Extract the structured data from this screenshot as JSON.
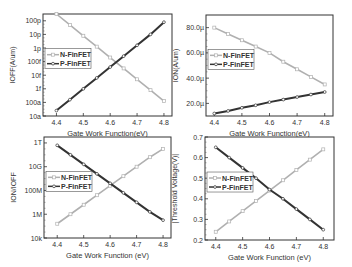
{
  "chart_data": [
    {
      "id": "ioff",
      "type": "line",
      "title": "",
      "xlabel": "Gate Work Function(eV)",
      "ylabel": "IOFF(A/um)",
      "yscale": "log",
      "xlim": [
        4.35,
        4.83
      ],
      "ylim_log10": [
        -17,
        -9.5
      ],
      "x_ticks": [
        4.4,
        4.5,
        4.6,
        4.7,
        4.8
      ],
      "x_tick_labels": [
        "4.4",
        "4.5",
        "4.6",
        "4.7",
        "4.8"
      ],
      "y_ticks_log10": [
        -17,
        -16,
        -15,
        -14,
        -13,
        -12,
        -11,
        -10
      ],
      "y_tick_labels": [
        "10a",
        "100a",
        "1f",
        "10f",
        "100f",
        "1p",
        "10p",
        "100p"
      ],
      "legend": {
        "position": "left-middle",
        "entries": [
          "N-FinFET",
          "P-FinFET"
        ]
      },
      "x": [
        4.4,
        4.45,
        4.5,
        4.55,
        4.6,
        4.65,
        4.7,
        4.75,
        4.8
      ],
      "series": [
        {
          "name": "N-FinFET",
          "color": "#b0b0b0",
          "marker": "square-open",
          "values_log10": [
            -9.5,
            -10.3,
            -11.1,
            -11.9,
            -12.7,
            -13.5,
            -14.3,
            -15.1,
            -15.9
          ]
        },
        {
          "name": "P-FinFET",
          "color": "#333333",
          "marker": "circle-open",
          "values_log10": [
            -16.6,
            -15.8,
            -15.0,
            -14.2,
            -13.4,
            -12.6,
            -11.8,
            -11.0,
            -10.1
          ]
        }
      ]
    },
    {
      "id": "ion",
      "type": "line",
      "title": "",
      "xlabel": "Gate Work Function(eV)",
      "ylabel": "ION(A/um)",
      "yscale": "linear",
      "xlim": [
        4.37,
        4.83
      ],
      "ylim": [
        10,
        90
      ],
      "y_unit": "µA/um",
      "x_ticks": [
        4.4,
        4.5,
        4.6,
        4.7,
        4.8
      ],
      "x_tick_labels": [
        "4.4",
        "4.5",
        "4.6",
        "4.7",
        "4.8"
      ],
      "y_ticks": [
        20,
        40,
        60,
        80
      ],
      "y_tick_labels": [
        "20.0µ",
        "40.0µ",
        "60.0µ",
        "80.0µ"
      ],
      "legend": {
        "position": "left-middle",
        "entries": [
          "N-FinFET",
          "P-FinFET"
        ]
      },
      "x": [
        4.4,
        4.45,
        4.5,
        4.55,
        4.6,
        4.65,
        4.7,
        4.75,
        4.8
      ],
      "series": [
        {
          "name": "N-FinFET",
          "color": "#b0b0b0",
          "marker": "square-open",
          "values": [
            80,
            75,
            70,
            65,
            60,
            53,
            47,
            41,
            35
          ]
        },
        {
          "name": "P-FinFET",
          "color": "#333333",
          "marker": "circle-open",
          "values": [
            12,
            14,
            16.5,
            18.5,
            21,
            23,
            25,
            27,
            29
          ]
        }
      ]
    },
    {
      "id": "ion_ioff",
      "type": "line",
      "title": "",
      "xlabel": "Gate Work Function (eV)",
      "ylabel": "ION/IOFF",
      "yscale": "log",
      "xlim": [
        4.35,
        4.83
      ],
      "ylim_log10": [
        4,
        12.5
      ],
      "x_ticks": [
        4.4,
        4.5,
        4.6,
        4.7,
        4.8
      ],
      "x_tick_labels": [
        "4.4",
        "4.5",
        "4.6",
        "4.7",
        "4.8"
      ],
      "y_ticks_log10": [
        4,
        6,
        8,
        10,
        12
      ],
      "y_tick_labels": [
        "10k",
        "1M",
        "100M",
        "10G",
        "1T"
      ],
      "legend": {
        "position": "left-middle",
        "entries": [
          "N-FinFET",
          "P-FinFET"
        ]
      },
      "x": [
        4.4,
        4.45,
        4.5,
        4.55,
        4.6,
        4.65,
        4.7,
        4.75,
        4.8
      ],
      "series": [
        {
          "name": "N-FinFET",
          "color": "#b0b0b0",
          "marker": "square-open",
          "values_log10": [
            5.2,
            6.0,
            6.8,
            7.6,
            8.4,
            9.2,
            10.0,
            10.8,
            11.5
          ]
        },
        {
          "name": "P-FinFET",
          "color": "#333333",
          "marker": "circle-open",
          "values_log10": [
            11.8,
            11.0,
            10.2,
            9.4,
            8.6,
            7.8,
            7.0,
            6.2,
            5.5
          ]
        }
      ]
    },
    {
      "id": "vth",
      "type": "line",
      "title": "",
      "xlabel": "Gate Work Function (eV)",
      "ylabel": "|Threshold Voltage(V)|",
      "yscale": "linear",
      "xlim": [
        4.36,
        4.84
      ],
      "ylim": [
        0.2,
        0.7
      ],
      "x_ticks": [
        4.4,
        4.5,
        4.6,
        4.7,
        4.8
      ],
      "x_tick_labels": [
        "4.4",
        "4.5",
        "4.6",
        "4.7",
        "4.8"
      ],
      "y_ticks": [
        0.2,
        0.3,
        0.4,
        0.5,
        0.6,
        0.7
      ],
      "y_tick_labels": [
        "0.2",
        "0.3",
        "0.4",
        "0.5",
        "0.6",
        "0.7"
      ],
      "legend": {
        "position": "left-middle",
        "entries": [
          "N-FinFET",
          "P-FinFET"
        ]
      },
      "x": [
        4.4,
        4.45,
        4.5,
        4.55,
        4.6,
        4.65,
        4.7,
        4.75,
        4.8
      ],
      "series": [
        {
          "name": "N-FinFET",
          "color": "#b0b0b0",
          "marker": "square-open",
          "values": [
            0.24,
            0.29,
            0.34,
            0.39,
            0.44,
            0.49,
            0.54,
            0.59,
            0.64
          ]
        },
        {
          "name": "P-FinFET",
          "color": "#333333",
          "marker": "circle-open",
          "values": [
            0.65,
            0.6,
            0.55,
            0.5,
            0.445,
            0.4,
            0.35,
            0.3,
            0.25
          ]
        }
      ]
    }
  ],
  "layout": {
    "panels": [
      {
        "id": "ioff",
        "frame": [
          43,
          14,
          172,
          116
        ],
        "label_pos": [
          100,
          128
        ]
      },
      {
        "id": "ion",
        "frame": [
          206,
          15,
          333,
          116
        ],
        "label_pos": [
          270,
          128
        ]
      },
      {
        "id": "ion_ioff",
        "frame": [
          44,
          137,
          171,
          238
        ],
        "label_pos": [
          108,
          250
        ]
      },
      {
        "id": "vth",
        "frame": [
          205,
          137,
          334,
          240
        ],
        "label_pos": [
          270,
          251
        ]
      }
    ]
  }
}
